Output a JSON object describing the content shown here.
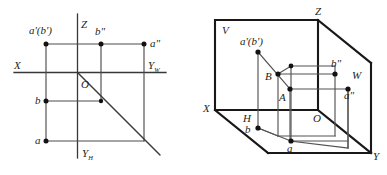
{
  "figure": {
    "type": "engineering-drawing",
    "background_color": "#ffffff",
    "line_color": "#3a3738",
    "point_color": "#141112"
  },
  "left_figure": {
    "name": "two-dimensional projection layout",
    "axes": {
      "x_label": "X",
      "z_label": "Z",
      "y_w_label": "Y",
      "y_w_subscript": "W",
      "y_h_label": "Y",
      "y_h_subscript": "H",
      "origin_label": "O"
    },
    "points": [
      {
        "id": "ab-prime",
        "label": "a'(b')",
        "x": 46,
        "y": 44
      },
      {
        "id": "b-double-prime",
        "label": "b\"",
        "x": 101,
        "y": 44
      },
      {
        "id": "a-double-prime",
        "label": "a\"",
        "x": 144,
        "y": 44
      },
      {
        "id": "b",
        "label": "b",
        "x": 46,
        "y": 101
      },
      {
        "id": "a",
        "label": "a",
        "x": 46,
        "y": 141
      }
    ],
    "diagonal": {
      "from_label": "O",
      "angle_degrees": 45
    }
  },
  "right_figure": {
    "name": "three-dimensional projection box",
    "planes": {
      "v_label": "V",
      "h_label": "H",
      "w_label": "W"
    },
    "axes": {
      "x_label": "X",
      "y_label": "Y",
      "z_label": "Z",
      "origin_label": "O"
    },
    "points": [
      {
        "id": "ab-prime",
        "label": "a'(b')",
        "x": 258,
        "y": 52
      },
      {
        "id": "B",
        "label": "B",
        "x": 278,
        "y": 74
      },
      {
        "id": "A",
        "label": "A",
        "x": 290,
        "y": 89
      },
      {
        "id": "b-double-prime",
        "label": "b\"",
        "x": 335,
        "y": 74
      },
      {
        "id": "a-double-prime",
        "label": "a\"",
        "x": 348,
        "y": 89
      },
      {
        "id": "b",
        "label": "b",
        "x": 258,
        "y": 128
      },
      {
        "id": "a",
        "label": "a",
        "x": 291,
        "y": 141
      }
    ]
  }
}
